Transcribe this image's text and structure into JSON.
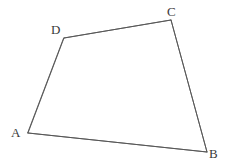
{
  "figure": {
    "name": "quadrilateral-abcd",
    "kind": "geometry-diagram",
    "background_color": "#ffffff",
    "stroke_color": "#555555",
    "stroke_width": 0.9,
    "label_color": "#3a3a3a",
    "canvas": {
      "width": 230,
      "height": 168
    },
    "vertices": [
      {
        "id": "A",
        "label": "A",
        "x": 28,
        "y": 133,
        "label_x": 15,
        "label_y": 135,
        "label_anchor": "left-of-vertex"
      },
      {
        "id": "B",
        "label": "B",
        "x": 207,
        "y": 152,
        "label_x": 214,
        "label_y": 156,
        "label_anchor": "right-of-vertex"
      },
      {
        "id": "C",
        "label": "C",
        "x": 171,
        "y": 20,
        "label_x": 172,
        "label_y": 14,
        "label_anchor": "above-vertex"
      },
      {
        "id": "D",
        "label": "D",
        "x": 64,
        "y": 38,
        "label_x": 56,
        "label_y": 32,
        "label_anchor": "upper-left-of-vertex"
      }
    ],
    "edges": [
      {
        "id": "AB",
        "from": "A",
        "to": "B",
        "label": "AB"
      },
      {
        "id": "BC",
        "from": "B",
        "to": "C",
        "label": "BC"
      },
      {
        "id": "CD",
        "from": "C",
        "to": "D",
        "label": "CD"
      },
      {
        "id": "DA",
        "from": "D",
        "to": "A",
        "label": "DA"
      }
    ],
    "path_points": "28,133 207,152 171,20 64,38",
    "closed": true
  }
}
